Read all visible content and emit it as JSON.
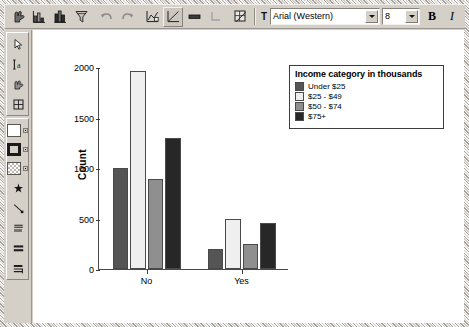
{
  "window": {
    "background_color": "#d4d0c8",
    "canvas_color": "#ffffff"
  },
  "toolbar": {
    "buttons": [
      {
        "name": "pointer-hand-icon",
        "title": "Select"
      },
      {
        "name": "bar-chart-icon",
        "title": "Bar chart"
      },
      {
        "name": "histogram-icon",
        "title": "Histogram"
      },
      {
        "name": "filter-icon",
        "title": "Filter"
      },
      {
        "name": "undo-icon",
        "title": "Undo"
      },
      {
        "name": "redo-icon",
        "title": "Redo"
      },
      {
        "name": "chart-edit-icon",
        "title": "Edit chart"
      },
      {
        "name": "chart-frame-icon",
        "title": "Chart frame"
      },
      {
        "name": "bar-fill-icon",
        "title": "Fill"
      },
      {
        "name": "corner-icon",
        "title": "Corner"
      },
      {
        "name": "grid-toggle-icon",
        "title": "Grid"
      }
    ],
    "font_label_icon": "text-format-icon",
    "font_name": "Arial (Western)",
    "font_size": "8",
    "bold_label": "B",
    "italic_label": "I"
  },
  "palette": {
    "tools": [
      {
        "name": "arrow-select-icon",
        "label": "Select arrow"
      },
      {
        "name": "text-insert-icon",
        "label": "Insert text"
      },
      {
        "name": "data-label-icon",
        "label": "Data labels"
      },
      {
        "name": "table-grid-icon",
        "label": "Grid"
      }
    ],
    "fills": [
      {
        "name": "fill-color-swatch",
        "label": "Fill color",
        "color": "#ffffff"
      },
      {
        "name": "border-color-swatch",
        "label": "Border color",
        "color": "#1a1a1a"
      },
      {
        "name": "pattern-swatch",
        "label": "Pattern fill",
        "color": "#d9d5ce"
      }
    ],
    "markers": [
      {
        "name": "marker-star-icon",
        "label": "Marker style"
      },
      {
        "name": "line-style-icon",
        "label": "Line style"
      },
      {
        "name": "spike-style-icon",
        "label": "Spikes"
      },
      {
        "name": "bar-style-icon",
        "label": "Bar style"
      },
      {
        "name": "bar-label-icon",
        "label": "Bar labels"
      }
    ]
  },
  "chart_data": {
    "type": "bar",
    "title": "",
    "xlabel": "Owns PDA",
    "ylabel": "Count",
    "categories": [
      "No",
      "Yes"
    ],
    "series": [
      {
        "name": "Under $25",
        "color": "#555555",
        "values": [
          1000,
          200
        ]
      },
      {
        "name": "$25 - $49",
        "color": "#efefef",
        "values": [
          1960,
          495
        ]
      },
      {
        "name": "$50 - $74",
        "color": "#8f8f8f",
        "values": [
          890,
          250
        ]
      },
      {
        "name": "$75+",
        "color": "#272727",
        "values": [
          1295,
          455
        ]
      }
    ],
    "ylim": [
      0,
      2000
    ],
    "yticks": [
      0,
      500,
      1000,
      1500,
      2000
    ],
    "ytick_labels": [
      "0",
      "500",
      "1000",
      "1500",
      "2000"
    ],
    "grid": false,
    "legend_position": "right",
    "legend_title": "Income category in thousands"
  }
}
